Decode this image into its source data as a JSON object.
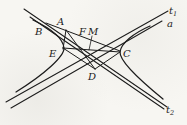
{
  "figure": {
    "background": "#f7f6f2",
    "stroke_color": "#1c1c1c",
    "strokes": [
      {
        "id": "tangent-line-t1",
        "d": "M 6 102 L 168 11",
        "w": 1.05
      },
      {
        "id": "asymptote-line-a",
        "d": "M 11 108 L 162 21",
        "w": 1.05
      },
      {
        "id": "tangent-line-t2",
        "d": "M 24 9 L 167 107",
        "w": 1.05
      },
      {
        "id": "companion-asymptote-line",
        "d": "M 30 17 L 164 109",
        "w": 1.05
      },
      {
        "id": "hyperbola-left-branch",
        "d": "M 33 20 C 52 29 63 39 64 48 C 64.5 56 45 74 16 92",
        "w": 1.25
      },
      {
        "id": "hyperbola-right-branch",
        "d": "M 150 26 C 134 33 121 43 120 52 C 119.5 60 136 77 163 99",
        "w": 1.25
      },
      {
        "id": "chord-B-A-F-C",
        "d": "M 46 23 L 120 51",
        "w": 1
      },
      {
        "id": "segment-A-E",
        "d": "M 66 30 L 63 49",
        "w": 1
      },
      {
        "id": "segment-A-D",
        "d": "M 66 30 L 95 69",
        "w": 1
      },
      {
        "id": "chord-E-M-C",
        "d": "M 63 48 L 120 52",
        "w": 1
      },
      {
        "id": "segment-E-D",
        "d": "M 63 48 L 95 69",
        "w": 1
      },
      {
        "id": "segment-D-C",
        "d": "M 95 69 L 120 52",
        "w": 1
      },
      {
        "id": "label-M-leader",
        "d": "M 92 36 L 89 50",
        "w": 0.8
      }
    ],
    "labels": [
      {
        "id": "point-label-A",
        "text": "A",
        "x": 57,
        "y": 25
      },
      {
        "id": "point-label-B",
        "text": "B",
        "x": 35,
        "y": 35
      },
      {
        "id": "point-label-E",
        "text": "E",
        "x": 49,
        "y": 57
      },
      {
        "id": "point-label-F",
        "text": "F",
        "x": 79,
        "y": 35
      },
      {
        "id": "point-label-M",
        "text": "M",
        "x": 88,
        "y": 35
      },
      {
        "id": "point-label-C",
        "text": "C",
        "x": 123,
        "y": 57
      },
      {
        "id": "point-label-D",
        "text": "D",
        "x": 88,
        "y": 80
      },
      {
        "id": "line-label-t1",
        "text": "t",
        "sub": "1",
        "x": 169,
        "y": 14
      },
      {
        "id": "line-label-a",
        "text": "a",
        "x": 167,
        "y": 27
      },
      {
        "id": "line-label-t2",
        "text": "t",
        "sub": "2",
        "x": 166,
        "y": 113
      }
    ]
  }
}
